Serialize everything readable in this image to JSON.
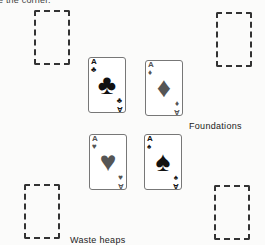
{
  "caption_partial": "e the corner.",
  "labels": {
    "foundations": "Foundations",
    "waste_heaps": "Waste heaps"
  },
  "foundations": [
    {
      "rank": "A",
      "suit": "clubs",
      "symbol": "♣",
      "color": "#111111"
    },
    {
      "rank": "A",
      "suit": "diamonds",
      "symbol": "♦",
      "color": "#555555"
    },
    {
      "rank": "A",
      "suit": "hearts",
      "symbol": "♥",
      "color": "#555555"
    },
    {
      "rank": "A",
      "suit": "spades",
      "symbol": "♠",
      "color": "#111111"
    }
  ],
  "waste_heaps": [
    {
      "position": "top-left",
      "state": "empty"
    },
    {
      "position": "top-right",
      "state": "empty"
    },
    {
      "position": "bottom-left",
      "state": "empty"
    },
    {
      "position": "bottom-right",
      "state": "empty"
    }
  ]
}
